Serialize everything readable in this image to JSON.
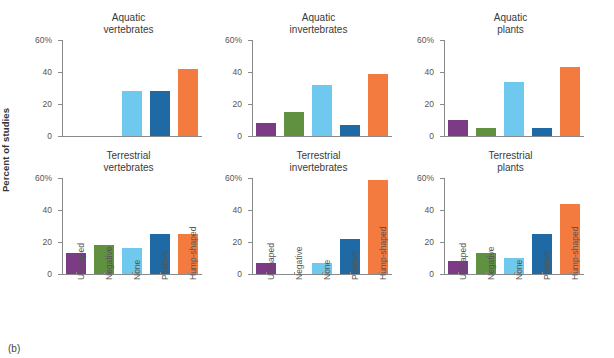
{
  "figure": {
    "caption": "(b)",
    "ylabel": "Percent of studies"
  },
  "chart_data": {
    "type": "bar",
    "title": "",
    "xlabel": "",
    "ylabel": "Percent of studies",
    "ylim": [
      0,
      60
    ],
    "yticks": [
      0,
      20,
      40,
      60
    ],
    "ytick_labels": [
      "0",
      "20",
      "40",
      "60%"
    ],
    "grid": false,
    "legend_position": "none",
    "categories": [
      "U-shaped",
      "Negative",
      "None",
      "Positive",
      "Hump-shaped"
    ],
    "category_colors": [
      "#7B3B85",
      "#5F9140",
      "#6FC9EE",
      "#1F6AA5",
      "#F47B40"
    ],
    "panels": [
      {
        "title_line1": "Aquatic",
        "title_line2": "vertebrates",
        "values": [
          0,
          0,
          28,
          28,
          42
        ]
      },
      {
        "title_line1": "Aquatic",
        "title_line2": "invertebrates",
        "values": [
          8,
          15,
          32,
          7,
          39
        ]
      },
      {
        "title_line1": "Aquatic",
        "title_line2": "plants",
        "values": [
          10,
          5,
          34,
          5,
          43
        ]
      },
      {
        "title_line1": "Terrestrial",
        "title_line2": "vertebrates",
        "values": [
          13,
          18,
          16,
          25,
          25
        ]
      },
      {
        "title_line1": "Terrestrial",
        "title_line2": "invertebrates",
        "values": [
          7,
          0,
          7,
          22,
          59
        ]
      },
      {
        "title_line1": "Terrestrial",
        "title_line2": "plants",
        "values": [
          8,
          13,
          10,
          25,
          44
        ]
      }
    ]
  }
}
